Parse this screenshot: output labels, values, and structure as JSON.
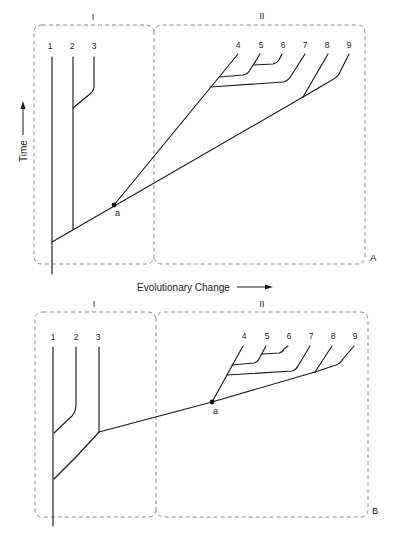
{
  "axes": {
    "y_label": "Time",
    "x_label": "Evolutionary Change"
  },
  "panels": [
    {
      "id": "A",
      "label": "A",
      "regions": [
        {
          "label": "I"
        },
        {
          "label": "II"
        }
      ],
      "taxa": [
        "1",
        "2",
        "3",
        "4",
        "5",
        "6",
        "7",
        "8",
        "9"
      ],
      "node_label": "a"
    },
    {
      "id": "B",
      "label": "B",
      "regions": [
        {
          "label": "I"
        },
        {
          "label": "II"
        }
      ],
      "taxa": [
        "1",
        "2",
        "3",
        "4",
        "5",
        "6",
        "7",
        "8",
        "9"
      ],
      "node_label": "a"
    }
  ],
  "diagram_data": {
    "type": "phylogenetic-tree-comparison",
    "panel_A": {
      "region_I_taxa": [
        "1",
        "2",
        "3"
      ],
      "region_II_taxa": [
        "4",
        "5",
        "6",
        "7",
        "8",
        "9"
      ],
      "topology": "(1,(2,3),(a:((4,(5,6)),7),(8,9)))",
      "note": "Lineage from root passes through node a and continues to clade (8,9); clade (4,(5,6),7) branches at a"
    },
    "panel_B": {
      "region_I_taxa": [
        "1",
        "2",
        "3"
      ],
      "region_II_taxa": [
        "4",
        "5",
        "6",
        "7",
        "8",
        "9"
      ],
      "topology": "((1,2),(3,(a:((4,(5,6)),7),(8,9))))",
      "note": "Node a lies on a lineage arising from the branch leading to taxon 3"
    }
  },
  "colors": {
    "lines": "#1a1a1a",
    "dashed_boxes": "#808080",
    "background": "#ffffff"
  }
}
